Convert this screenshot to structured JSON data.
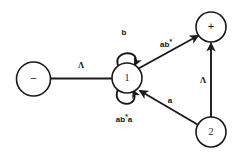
{
  "diagram": {
    "kind": "finite-state-automaton",
    "canvas": {
      "width": 246,
      "height": 154,
      "background": "#ffffff"
    },
    "ink_color": "#1a1a1a",
    "nodes": [
      {
        "id": "start",
        "label": "−",
        "cx": 33.5,
        "cy": 79,
        "r": 17
      },
      {
        "id": "s1",
        "label": "1",
        "cx": 127,
        "cy": 78,
        "r": 15
      },
      {
        "id": "accept",
        "label": "+",
        "cx": 211,
        "cy": 27,
        "r": 15
      },
      {
        "id": "s2",
        "label": "2",
        "cx": 211,
        "cy": 132,
        "r": 15
      }
    ],
    "edges": [
      {
        "id": "start-to-1",
        "from": "start",
        "to": "s1",
        "label": "Λ"
      },
      {
        "id": "1-to-accept",
        "from": "s1",
        "to": "accept",
        "label": "ab*"
      },
      {
        "id": "2-to-accept",
        "from": "s2",
        "to": "accept",
        "label": "Λ"
      },
      {
        "id": "2-to-1",
        "from": "s2",
        "to": "s1",
        "label": "a"
      },
      {
        "id": "1-loop-top",
        "from": "s1",
        "to": "s1",
        "label": "b"
      },
      {
        "id": "1-loop-bottom",
        "from": "s1",
        "to": "s1",
        "label": "ab*a"
      }
    ],
    "labels": {
      "start_arrow": "Λ",
      "accept_edge": "ab*",
      "lambda_right": "Λ",
      "a_edge": "a",
      "loop_top": "b",
      "loop_bottom": "ab*a",
      "loop_bottom_base": "ab",
      "loop_bottom_star": "*",
      "loop_bottom_tail": "a",
      "accept_edge_base": "ab",
      "accept_edge_star": "*"
    }
  }
}
